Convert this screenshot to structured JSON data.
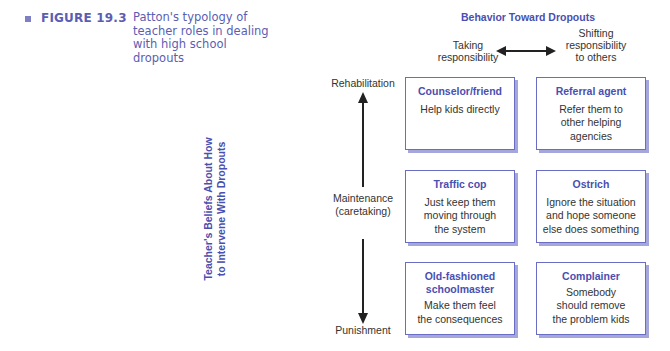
{
  "figure": {
    "number": "FIGURE 19.3",
    "caption_lines": [
      "Patton's typology of",
      "teacher roles in dealing",
      "with high school",
      "dropouts"
    ],
    "accent_color": "#5a5eb3"
  },
  "columns": {
    "title": "Behavior Toward Dropouts",
    "left_label": [
      "Taking",
      "responsibility"
    ],
    "right_label": [
      "Shifting",
      "responsibility",
      "to others"
    ],
    "arrow": "double-headed-horizontal"
  },
  "rows": {
    "axis_title": [
      "Teacher's Beliefs About How",
      "to Intervene With Dropouts"
    ],
    "top_label": "Rehabilitation",
    "middle_label": [
      "Maintenance",
      "(caretaking)"
    ],
    "bottom_label": "Punishment",
    "arrow": "double-headed-vertical"
  },
  "roles": [
    {
      "row": "Rehabilitation",
      "column": "Taking responsibility",
      "title": [
        "Counselor/friend"
      ],
      "description": [
        "Help kids directly"
      ]
    },
    {
      "row": "Rehabilitation",
      "column": "Shifting responsibility to others",
      "title": [
        "Referral agent"
      ],
      "description": [
        "Refer them to",
        "other helping",
        "agencies"
      ]
    },
    {
      "row": "Maintenance",
      "column": "Taking responsibility",
      "title": [
        "Traffic cop"
      ],
      "description": [
        "Just keep them",
        "moving through",
        "the system"
      ]
    },
    {
      "row": "Maintenance",
      "column": "Shifting responsibility to others",
      "title": [
        "Ostrich"
      ],
      "description": [
        "Ignore the situation",
        "and hope someone",
        "else does something"
      ]
    },
    {
      "row": "Punishment",
      "column": "Taking responsibility",
      "title": [
        "Old-fashioned",
        "schoolmaster"
      ],
      "description": [
        "Make them feel",
        "the consequences"
      ]
    },
    {
      "row": "Punishment",
      "column": "Shifting responsibility to others",
      "title": [
        "Complainer"
      ],
      "description": [
        "Somebody",
        "should remove",
        "the problem kids"
      ]
    }
  ],
  "colors": {
    "title_blue": "#4a4fb0",
    "box_border": "#6a6dc4",
    "box_shadow": "#a4a6dc",
    "body_text": "#333333"
  }
}
